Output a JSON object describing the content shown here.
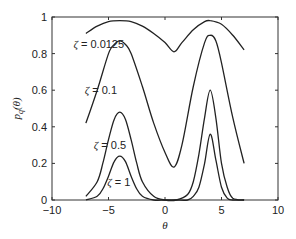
{
  "chart_data": {
    "type": "line",
    "title": "",
    "xlabel": "θ",
    "ylabel_main": "p",
    "ylabel_sub": "q",
    "ylabel_arg": "(θ)",
    "xlim": [
      -10,
      10
    ],
    "ylim": [
      0,
      1
    ],
    "xticks": [
      -10,
      -5,
      0,
      5,
      10
    ],
    "xtick_labels": [
      "−10",
      "−5",
      "0",
      "5",
      "10"
    ],
    "yticks": [
      0,
      0.2,
      0.4,
      0.6,
      0.8,
      1
    ],
    "ytick_labels": [
      "0",
      "0.2",
      "0.4",
      "0.6",
      "0.8",
      "1"
    ],
    "grid": false,
    "legend": "none",
    "x_range_of_curves": [
      -7,
      7
    ],
    "series": [
      {
        "name": "ζ = 0.0125",
        "label_symbol": "ζ",
        "label_value": "= 0.0125",
        "peaks": [
          {
            "x": -4,
            "y": 0.98
          },
          {
            "x": 4,
            "y": 0.98
          }
        ],
        "x": [
          -7,
          -6,
          -5,
          -4,
          -3,
          -2,
          -1,
          0,
          0.8,
          1.5,
          2.5,
          3.5,
          4,
          5,
          6,
          7
        ],
        "y": [
          0.91,
          0.95,
          0.975,
          0.98,
          0.975,
          0.95,
          0.91,
          0.86,
          0.81,
          0.86,
          0.93,
          0.975,
          0.98,
          0.96,
          0.9,
          0.82
        ]
      },
      {
        "name": "ζ = 0.1",
        "label_symbol": "ζ",
        "label_value": "= 0.1",
        "x": [
          -7,
          -6,
          -5,
          -4.5,
          -4,
          -3.5,
          -3,
          -2,
          -1,
          0,
          0.8,
          1.5,
          2.5,
          3.5,
          4,
          4.5,
          5,
          6,
          7
        ],
        "y": [
          0.42,
          0.6,
          0.8,
          0.85,
          0.87,
          0.85,
          0.8,
          0.62,
          0.42,
          0.26,
          0.18,
          0.3,
          0.62,
          0.86,
          0.9,
          0.87,
          0.75,
          0.45,
          0.2
        ]
      },
      {
        "name": "ζ = 0.5",
        "label_symbol": "ζ",
        "label_value": "= 0.5",
        "x": [
          -7,
          -6,
          -5.5,
          -5,
          -4.5,
          -4,
          -3.5,
          -3,
          -2.5,
          -2,
          -1,
          0,
          1,
          2,
          2.5,
          3,
          3.5,
          4,
          4.5,
          5,
          5.5,
          6,
          7
        ],
        "y": [
          0.02,
          0.1,
          0.2,
          0.33,
          0.44,
          0.48,
          0.44,
          0.33,
          0.2,
          0.1,
          0.02,
          0.0,
          0.0,
          0.03,
          0.1,
          0.25,
          0.45,
          0.6,
          0.45,
          0.2,
          0.07,
          0.01,
          0.0
        ]
      },
      {
        "name": "ζ = 1",
        "label_symbol": "ζ",
        "label_value": "= 1",
        "x": [
          -7,
          -6,
          -5.5,
          -5,
          -4.5,
          -4,
          -3.5,
          -3,
          -2.5,
          -2,
          -1,
          0,
          1,
          2,
          2.5,
          3,
          3.5,
          4,
          4.5,
          5,
          5.5,
          6,
          7
        ],
        "y": [
          0.0,
          0.02,
          0.06,
          0.13,
          0.21,
          0.24,
          0.21,
          0.13,
          0.06,
          0.02,
          0.0,
          0.0,
          0.0,
          0.0,
          0.02,
          0.07,
          0.2,
          0.36,
          0.22,
          0.07,
          0.01,
          0.0,
          0.0
        ]
      }
    ],
    "annotations": [
      {
        "series": 0,
        "x": -8.1,
        "y": 0.85
      },
      {
        "series": 1,
        "x": -7.1,
        "y": 0.6
      },
      {
        "series": 2,
        "x": -6.3,
        "y": 0.3
      },
      {
        "series": 3,
        "x": -5.1,
        "y": 0.1
      }
    ]
  }
}
